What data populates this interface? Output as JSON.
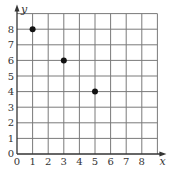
{
  "chart_data": {
    "type": "scatter",
    "title": "",
    "xlabel": "x",
    "ylabel": "y",
    "xlim": [
      0,
      9
    ],
    "ylim": [
      0,
      9
    ],
    "grid": true,
    "legend": null,
    "x_ticks": [
      "0",
      "1",
      "2",
      "3",
      "4",
      "5",
      "6",
      "7",
      "8"
    ],
    "y_ticks": [
      "0",
      "1",
      "2",
      "3",
      "4",
      "5",
      "6",
      "7",
      "8"
    ],
    "series": [
      {
        "name": "points",
        "points": [
          {
            "x": 1,
            "y": 8
          },
          {
            "x": 3,
            "y": 6
          },
          {
            "x": 5,
            "y": 4
          }
        ]
      }
    ]
  },
  "colors": {
    "grid": "#7a7a7a",
    "axis": "#333333",
    "point": "#111111",
    "background": "#ffffff"
  }
}
